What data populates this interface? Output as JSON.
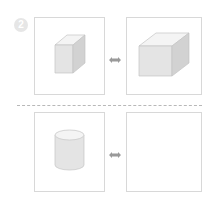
{
  "puzzle": {
    "number": "2",
    "rows": [
      {
        "left": {
          "shape": "cube",
          "label": "cube-icon"
        },
        "relation": "double-arrow-icon",
        "right": {
          "shape": "cuboid",
          "label": "cuboid-icon"
        }
      },
      {
        "left": {
          "shape": "cylinder",
          "label": "cylinder-icon"
        },
        "relation": "double-arrow-icon",
        "right": {
          "shape": "empty",
          "label": "blank-answer-box"
        }
      }
    ]
  },
  "colors": {
    "border": "#d8d8d8",
    "shape_top": "#f4f4f4",
    "shape_front": "#e4e4e4",
    "shape_side": "#d2d2d2",
    "arrow": "#9a9a9a",
    "badge": "#e6e6e6"
  }
}
